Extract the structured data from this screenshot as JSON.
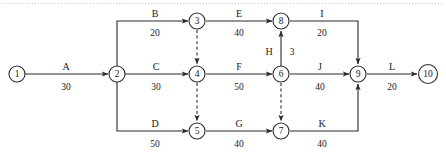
{
  "diagram": {
    "kind": "activity-on-arrow-network",
    "colors": {
      "stroke": "#2b2b2b",
      "node_fill": "#ffffff",
      "text": "#1a1a1a",
      "background": "#ffffff",
      "top_rule": "#b9b9c4"
    },
    "nodes": [
      {
        "id": "1",
        "label": "1",
        "cx": 17,
        "cy": 74,
        "r": 8
      },
      {
        "id": "2",
        "label": "2",
        "cx": 117,
        "cy": 74,
        "r": 8
      },
      {
        "id": "3",
        "label": "3",
        "cx": 197,
        "cy": 21,
        "r": 8
      },
      {
        "id": "4",
        "label": "4",
        "cx": 197,
        "cy": 74,
        "r": 8
      },
      {
        "id": "5",
        "label": "5",
        "cx": 197,
        "cy": 131,
        "r": 8
      },
      {
        "id": "6",
        "label": "6",
        "cx": 281,
        "cy": 74,
        "r": 8
      },
      {
        "id": "7",
        "label": "7",
        "cx": 281,
        "cy": 131,
        "r": 8
      },
      {
        "id": "8",
        "label": "8",
        "cx": 281,
        "cy": 21,
        "r": 8
      },
      {
        "id": "9",
        "label": "9",
        "cx": 358,
        "cy": 74,
        "r": 8
      },
      {
        "id": "10",
        "label": "10",
        "cx": 428,
        "cy": 74,
        "r": 9.5
      }
    ],
    "edges": [
      {
        "id": "A",
        "name": "A",
        "duration": "30",
        "from": "1",
        "to": "2",
        "style": "solid",
        "points": "25,74 108,74",
        "name_x": 66,
        "name_y": 70,
        "dur_x": 66,
        "dur_y": 90
      },
      {
        "id": "B",
        "name": "B",
        "duration": "20",
        "from": "2",
        "to": "3",
        "style": "solid",
        "points": "117,66 117,21 188,21",
        "name_x": 155,
        "name_y": 17,
        "dur_x": 155,
        "dur_y": 36
      },
      {
        "id": "C",
        "name": "C",
        "duration": "30",
        "from": "2",
        "to": "4",
        "style": "solid",
        "points": "125,74 188,74",
        "name_x": 156,
        "name_y": 70,
        "dur_x": 156,
        "dur_y": 90
      },
      {
        "id": "D",
        "name": "D",
        "duration": "50",
        "from": "2",
        "to": "5",
        "style": "solid",
        "points": "117,82 117,131 188,131",
        "name_x": 155,
        "name_y": 127,
        "dur_x": 155,
        "dur_y": 147
      },
      {
        "id": "E",
        "name": "E",
        "duration": "40",
        "from": "3",
        "to": "8",
        "style": "solid",
        "points": "206,21 272,21",
        "name_x": 239,
        "name_y": 17,
        "dur_x": 239,
        "dur_y": 36
      },
      {
        "id": "F",
        "name": "F",
        "duration": "50",
        "from": "4",
        "to": "6",
        "style": "solid",
        "points": "206,74 272,74",
        "name_x": 239,
        "name_y": 70,
        "dur_x": 239,
        "dur_y": 90
      },
      {
        "id": "G",
        "name": "G",
        "duration": "40",
        "from": "5",
        "to": "7",
        "style": "solid",
        "points": "206,131 272,131",
        "name_x": 239,
        "name_y": 127,
        "dur_x": 239,
        "dur_y": 147
      },
      {
        "id": "H",
        "name": "H",
        "duration": "3",
        "from": "6",
        "to": "8",
        "style": "solid",
        "points": "281,66 281,31",
        "name_x": 269,
        "name_y": 55,
        "dur_x": 292,
        "dur_y": 55
      },
      {
        "id": "I",
        "name": "I",
        "duration": "20",
        "from": "8",
        "to": "9",
        "style": "solid",
        "points": "290,21 358,21 358,64",
        "name_x": 322,
        "name_y": 17,
        "dur_x": 322,
        "dur_y": 36
      },
      {
        "id": "J",
        "name": "J",
        "duration": "40",
        "from": "6",
        "to": "9",
        "style": "solid",
        "points": "290,74 349,74",
        "name_x": 320,
        "name_y": 70,
        "dur_x": 320,
        "dur_y": 90
      },
      {
        "id": "K",
        "name": "K",
        "duration": "40",
        "from": "7",
        "to": "9",
        "style": "solid",
        "points": "290,131 358,131 358,84",
        "name_x": 322,
        "name_y": 127,
        "dur_x": 322,
        "dur_y": 147
      },
      {
        "id": "L",
        "name": "L",
        "duration": "20",
        "from": "9",
        "to": "10",
        "style": "solid",
        "points": "367,74 417,74",
        "name_x": 392,
        "name_y": 70,
        "dur_x": 392,
        "dur_y": 90
      }
    ],
    "dummy_edges": [
      {
        "id": "d34",
        "from": "3",
        "to": "4",
        "style": "dashed",
        "points": "197,30 197,64"
      },
      {
        "id": "d45",
        "from": "4",
        "to": "5",
        "style": "dashed",
        "points": "197,83 197,121"
      },
      {
        "id": "d67",
        "from": "6",
        "to": "7",
        "style": "dashed",
        "points": "281,83 281,121"
      }
    ],
    "top_rule": {
      "x1": 3,
      "y1": 3.5,
      "x2": 443,
      "y2": 3.5
    }
  }
}
